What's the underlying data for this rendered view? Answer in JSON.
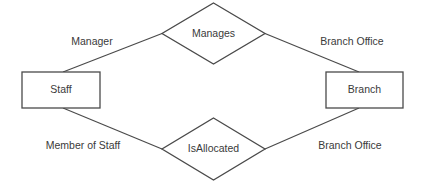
{
  "diagram": {
    "kind": "entity-relationship-diagram",
    "canvas": {
      "width": 425,
      "height": 183,
      "background": "#ffffff"
    },
    "style": {
      "line_color": "#4a4a4a",
      "text_color": "#3a3a3a",
      "shape_fill": "#ffffff"
    },
    "entities": [
      {
        "id": "staff",
        "label": "Staff",
        "shape": "rectangle",
        "x": 22,
        "y": 72,
        "width": 78,
        "height": 36,
        "center_x": 61,
        "center_y": 90
      },
      {
        "id": "branch",
        "label": "Branch",
        "shape": "rectangle",
        "x": 326,
        "y": 72,
        "width": 77,
        "height": 36,
        "center_x": 364.5,
        "center_y": 90
      }
    ],
    "relationships": [
      {
        "id": "manages",
        "label": "Manages",
        "shape": "diamond",
        "center_x": 213.5,
        "center_y": 33.5,
        "half_width": 51.5,
        "half_height": 30.5,
        "points": "213.5,3 265,33.5 213.5,64 162,33.5"
      },
      {
        "id": "isallocated",
        "label": "IsAllocated",
        "shape": "diamond",
        "center_x": 213.5,
        "center_y": 149,
        "half_width": 51.5,
        "half_height": 31,
        "points": "213.5,118 265,149 213.5,180 162,149"
      }
    ],
    "connectors": [
      {
        "id": "staff-manages",
        "from": "staff",
        "to": "manages",
        "role_label": "Manager",
        "path": "M 63,72 L 162,33.5"
      },
      {
        "id": "manages-branch",
        "from": "manages",
        "to": "branch",
        "role_label": "Branch Office",
        "path": "M 265,33.5 L 359,72"
      },
      {
        "id": "staff-isallocated",
        "from": "staff",
        "to": "isallocated",
        "role_label": "Member of Staff",
        "path": "M 63,108 L 162,149"
      },
      {
        "id": "isallocated-branch",
        "from": "isallocated",
        "to": "branch",
        "role_label": "Branch Office",
        "path": "M 265,149 L 359,108"
      }
    ],
    "role_labels": [
      {
        "id": "manager",
        "text": "Manager",
        "x": 92,
        "y": 42
      },
      {
        "id": "branch-office-top",
        "text": "Branch Office",
        "x": 352,
        "y": 42
      },
      {
        "id": "member-of-staff",
        "text": "Member of Staff",
        "x": 83,
        "y": 146
      },
      {
        "id": "branch-office-bottom",
        "text": "Branch Office",
        "x": 350,
        "y": 146
      }
    ]
  }
}
